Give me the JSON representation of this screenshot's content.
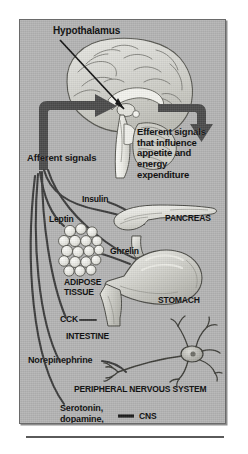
{
  "figure": {
    "background_color": "#b4b4b4",
    "arrow_color": "#4a4a4a",
    "line_color": "#3a3a3a",
    "text_color": "#0a0a0a"
  },
  "labels": {
    "hypothalamus": "Hypothalamus",
    "efferent": "Efferent signals\nthat influence\nappetite and\nenergy\nexpenditure",
    "afferent": "Afferent signals",
    "insulin": "Insulin",
    "leptin": "Leptin",
    "pancreas": "PANCREAS",
    "ghrelin": "Ghrelin",
    "adipose": "ADIPOSE\nTISSUE",
    "stomach": "STOMACH",
    "cck": "CCK",
    "intestine": "INTESTINE",
    "norepinephrine": "Norepinephrine",
    "peripheral_nervous_system": "PERIPHERAL NERVOUS SYSTEM",
    "serotonin": "Serotonin,\ndopamine,\nmany others",
    "cns": "CNS"
  },
  "organs": [
    {
      "name": "brain",
      "label": "Hypothalamus"
    },
    {
      "name": "pancreas",
      "label": "PANCREAS"
    },
    {
      "name": "adipose-tissue",
      "label": "ADIPOSE TISSUE"
    },
    {
      "name": "stomach",
      "label": "STOMACH"
    },
    {
      "name": "intestine",
      "label": "INTESTINE"
    },
    {
      "name": "neuron",
      "label": "PERIPHERAL NERVOUS SYSTEM"
    }
  ],
  "signals": [
    {
      "name": "insulin",
      "source": "pancreas",
      "direction": "afferent"
    },
    {
      "name": "leptin",
      "source": "adipose-tissue",
      "direction": "afferent"
    },
    {
      "name": "ghrelin",
      "source": "stomach",
      "direction": "afferent"
    },
    {
      "name": "cck",
      "source": "intestine",
      "direction": "afferent"
    },
    {
      "name": "norepinephrine",
      "source": "peripheral-nervous-system",
      "direction": "afferent"
    },
    {
      "name": "serotonin-dopamine",
      "source": "cns",
      "direction": "afferent"
    }
  ]
}
